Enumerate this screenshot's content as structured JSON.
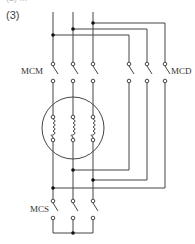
{
  "figure": {
    "label": "(3)",
    "top_partial_text": "(2) ...",
    "labels": {
      "main_contactor": "MCM",
      "delta_contactor": "MCD",
      "star_contactor": "MCS"
    },
    "colors": {
      "line": "#444444",
      "dot": "#111111"
    }
  }
}
